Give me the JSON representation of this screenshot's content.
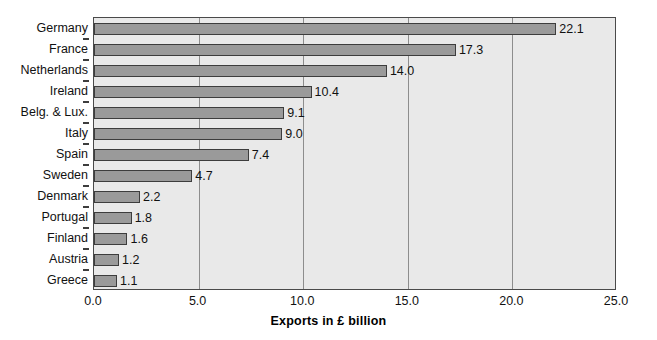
{
  "chart_data": {
    "type": "bar",
    "orientation": "horizontal",
    "title": "",
    "xlabel": "Exports in £ billion",
    "ylabel": "",
    "xlim": [
      0.0,
      25.0
    ],
    "xticks": [
      "0.0",
      "5.0",
      "10.0",
      "15.0",
      "20.0",
      "25.0"
    ],
    "xtick_values": [
      0,
      5,
      10,
      15,
      20,
      25
    ],
    "grid": "vertical",
    "legend": "none",
    "categories": [
      "Germany",
      "France",
      "Netherlands",
      "Ireland",
      "Belg. & Lux.",
      "Italy",
      "Spain",
      "Sweden",
      "Denmark",
      "Portugal",
      "Finland",
      "Austria",
      "Greece"
    ],
    "values": [
      22.1,
      17.3,
      14.0,
      10.4,
      9.1,
      9.0,
      7.4,
      4.7,
      2.2,
      1.8,
      1.6,
      1.2,
      1.1
    ],
    "value_labels": [
      "22.1",
      "17.3",
      "14.0",
      "10.4",
      "9.1",
      "9.0",
      "7.4",
      "4.7",
      "2.2",
      "1.8",
      "1.6",
      "1.2",
      "1.1"
    ],
    "colors": {
      "bar_fill": "#9a9a9a",
      "bar_outline": "#3d3d3d",
      "plot_background": "#e9e9e9",
      "gridline": "#8d8d8d",
      "axis": "#4a4a4a",
      "text": "#111111"
    }
  }
}
